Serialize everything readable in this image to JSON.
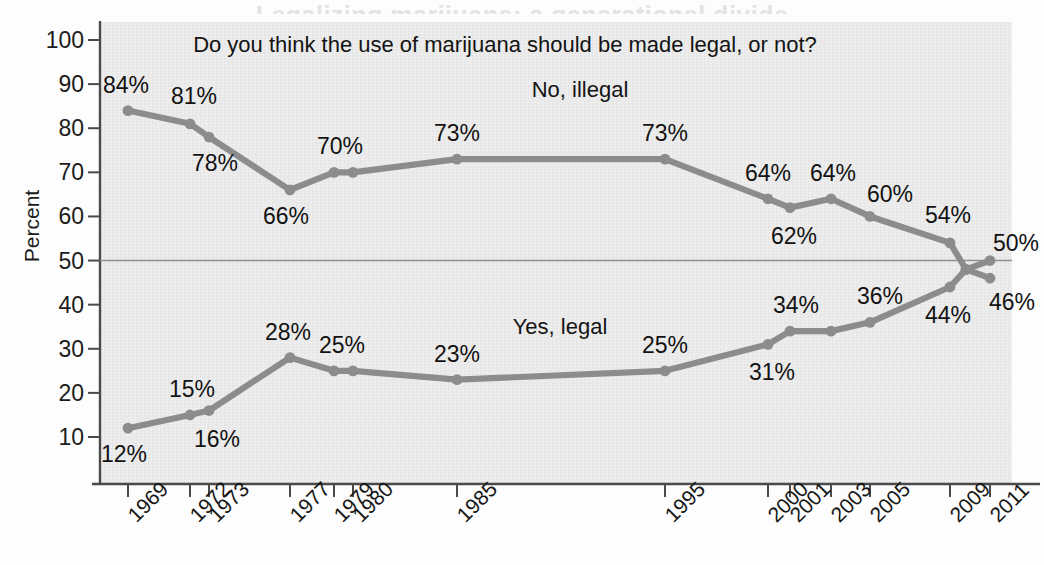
{
  "page": {
    "title_remnant": "Legalizing marijuana: a generational divide",
    "background_color": "#fdfdfd",
    "plot_background_color": "#eaeaea",
    "series_color": "#8c8c8c",
    "axis_color": "#4a4a4a",
    "text_color": "#131313"
  },
  "question": "Do you think the use of marijuana should be made legal, or not?",
  "axes": {
    "ylabel": "Percent",
    "yticks": [
      10,
      20,
      30,
      40,
      50,
      60,
      70,
      80,
      90,
      100
    ],
    "ytick_labels": [
      "10",
      "20",
      "30",
      "40",
      "50",
      "60",
      "70",
      "80",
      "90",
      "100"
    ],
    "ylim": [
      0,
      104
    ],
    "xtick_labels": [
      "1969",
      "1972",
      "1973",
      "1977",
      "1979",
      "1980",
      "1985",
      "1995",
      "2000",
      "2001",
      "2003",
      "2005",
      "2009",
      "2011"
    ],
    "gridline_at": 50,
    "grid": "single horizontal line at 50"
  },
  "chart_data": {
    "type": "line",
    "title": "Do you think the use of marijuana should be made legal, or not?",
    "xlabel": "",
    "ylabel": "Percent",
    "ylim": [
      0,
      104
    ],
    "grid": false,
    "gridlines": [
      50
    ],
    "legend_position": "inline labels on plot",
    "x": [
      "1969",
      "1972",
      "1973",
      "1977",
      "1979",
      "1980",
      "1985",
      "1995",
      "2000",
      "2001",
      "2003",
      "2005",
      "2009",
      "2010",
      "2011"
    ],
    "series": [
      {
        "name": "No, illegal",
        "color": "#8c8c8c",
        "values": [
          84,
          81,
          78,
          66,
          70,
          70,
          73,
          73,
          64,
          62,
          64,
          60,
          54,
          48,
          50
        ],
        "labels": [
          "84%",
          "81%",
          "78%",
          "66%",
          "70%",
          "",
          "73%",
          "73%",
          "64%",
          "62%",
          "64%",
          "60%",
          "54%",
          "",
          "50%"
        ]
      },
      {
        "name": "Yes, legal",
        "color": "#8c8c8c",
        "values": [
          12,
          15,
          16,
          28,
          25,
          25,
          23,
          25,
          31,
          34,
          34,
          36,
          44,
          48,
          46
        ],
        "labels": [
          "12%",
          "15%",
          "16%",
          "28%",
          "25%",
          "",
          "23%",
          "25%",
          "31%",
          "34%",
          "34%",
          "36%",
          "44%",
          "",
          "46%"
        ]
      }
    ],
    "annotations": [
      {
        "text": "No, illegal",
        "series": "No, illegal"
      },
      {
        "text": "Yes, legal",
        "series": "Yes, legal"
      }
    ]
  },
  "series_labels": {
    "upper": "No, illegal",
    "lower": "Yes, legal"
  },
  "value_labels": {
    "upper": [
      "84%",
      "81%",
      "78%",
      "66%",
      "70%",
      "73%",
      "73%",
      "64%",
      "62%",
      "64%",
      "60%",
      "54%",
      "50%"
    ],
    "lower": [
      "12%",
      "15%",
      "16%",
      "28%",
      "25%",
      "23%",
      "25%",
      "31%",
      "34%",
      "36%",
      "44%",
      "46%"
    ]
  }
}
